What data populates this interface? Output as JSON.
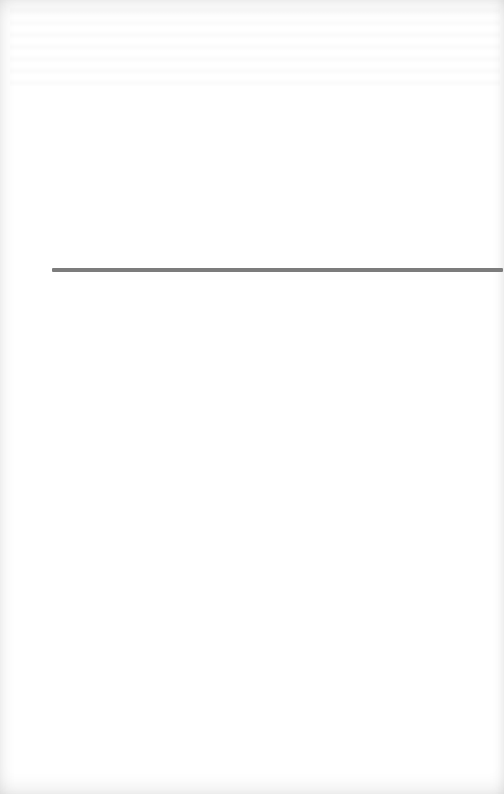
{
  "page": {
    "type": "scanned-book-page",
    "background_color": "#ffffff",
    "edge_shading_color": "#e6e6e6"
  },
  "rule": {
    "color": "#7c7c7c",
    "thickness_px": 4,
    "x_start": 52,
    "x_end": 503,
    "y": 270
  },
  "bleed_through": {
    "legible": false,
    "text": ""
  }
}
